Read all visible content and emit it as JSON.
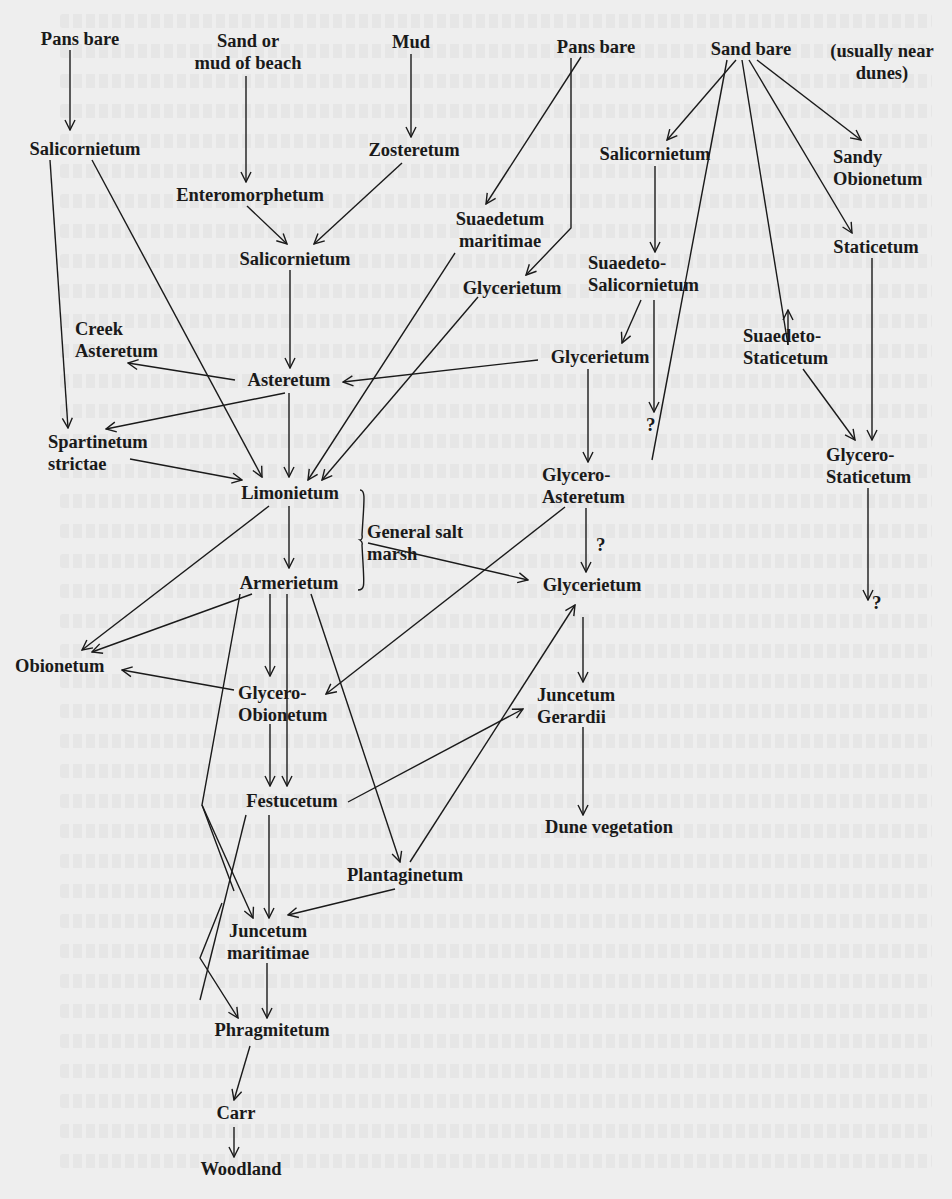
{
  "diagram": {
    "colors": {
      "paper": "#eeeeee",
      "ink": "#1a1a1a"
    },
    "nodes": {
      "pans_bare_1": "Pans bare",
      "sand_or_mud": "Sand or\nmud of beach",
      "mud": "Mud",
      "pans_bare_2": "Pans bare",
      "sand_bare": "Sand bare",
      "usually_near_dunes": "(usually near\ndunes)",
      "salicornietum_1": "Salicornietum",
      "zosteretum": "Zosteretum",
      "enteromorphetum": "Enteromorphetum",
      "salicornietum_2": "Salicornietum",
      "suaedetum_maritimae": "Suaedetum\nmaritimae",
      "salicornietum_3": "Salicornietum",
      "sandy_obionetum": "Sandy\nObionetum",
      "staticetum": "Staticetum",
      "suaedeto_salicornietum": "Suaedeto-\nSalicornietum",
      "glycerietum_1": "Glycerietum",
      "glycerietum_2": "Glycerietum",
      "suaedeto_staticetum": "Suaedeto-\nStaticetum",
      "creek_asteretum": "Creek\nAsteretum",
      "asteretum": "Asteretum",
      "spartinetum_strictae": "Spartinetum\nstrictae",
      "glycero_staticetum": "Glycero-\nStaticetum",
      "limonietum": "Limonietum",
      "glycero_asteretum": "Glycero-\nAsteretum",
      "general_salt_marsh": "General salt\nmarsh",
      "armerietum": "Armerietum",
      "glycerietum_3": "Glycerietum",
      "obionetum": "Obionetum",
      "glycero_obionetum": "Glycero-\nObionetum",
      "juncetum_gerardii": "Juncetum\nGerardii",
      "festucetum": "Festucetum",
      "dune_vegetation": "Dune vegetation",
      "plantaginetum": "Plantaginetum",
      "juncetum_maritimae": "Juncetum\nmaritimae",
      "phragmitetum": "Phragmitetum",
      "carr": "Carr",
      "woodland": "Woodland"
    },
    "unknown_marks": {
      "q1": "?",
      "q2": "?",
      "q3": "?"
    },
    "edges": [
      [
        "Pans bare",
        "Salicornietum"
      ],
      [
        "Sand or mud of beach",
        "Enteromorphetum"
      ],
      [
        "Mud",
        "Zosteretum"
      ],
      [
        "Enteromorphetum",
        "Salicornietum"
      ],
      [
        "Zosteretum",
        "Salicornietum"
      ],
      [
        "Pans bare",
        "Suaedetum maritimae"
      ],
      [
        "Pans bare",
        "Glycerietum"
      ],
      [
        "Sand bare",
        "Salicornietum"
      ],
      [
        "Sand bare",
        "Sandy Obionetum"
      ],
      [
        "Sand bare",
        "Staticetum"
      ],
      [
        "Sand bare",
        "Suaedeto-Staticetum"
      ],
      [
        "Sand bare",
        "?"
      ],
      [
        "Salicornietum",
        "Suaedeto-Salicornietum"
      ],
      [
        "Suaedeto-Salicornietum",
        "Glycerietum"
      ],
      [
        "Salicornietum",
        "Asteretum"
      ],
      [
        "Salicornietum",
        "Spartinetum strictae"
      ],
      [
        "Salicornietum",
        "Limonietum"
      ],
      [
        "Asteretum",
        "Creek Asteretum"
      ],
      [
        "Asteretum",
        "Spartinetum strictae"
      ],
      [
        "Asteretum",
        "Limonietum"
      ],
      [
        "Glycerietum",
        "Asteretum"
      ],
      [
        "Suaedetum maritimae",
        "Limonietum"
      ],
      [
        "Glycerietum",
        "Limonietum"
      ],
      [
        "Spartinetum strictae",
        "Limonietum"
      ],
      [
        "Glycerietum",
        "Glycero-Asteretum"
      ],
      [
        "Glycero-Asteretum",
        "Glycerietum (?)"
      ],
      [
        "Glycero-Asteretum",
        "Glycero-Obionetum"
      ],
      [
        "Suaedeto-Staticetum",
        "Glycero-Staticetum"
      ],
      [
        "Staticetum",
        "Glycero-Staticetum"
      ],
      [
        "Glycero-Staticetum",
        "?"
      ],
      [
        "Limonietum",
        "Armerietum"
      ],
      [
        "Limonietum",
        "Obionetum"
      ],
      [
        "General salt marsh",
        "Glycerietum"
      ],
      [
        "Armerietum",
        "Obionetum"
      ],
      [
        "Armerietum",
        "Glycero-Obionetum"
      ],
      [
        "Armerietum",
        "Festucetum"
      ],
      [
        "Armerietum",
        "Plantaginetum"
      ],
      [
        "Armerietum",
        "Phragmitetum"
      ],
      [
        "Glycero-Obionetum",
        "Obionetum"
      ],
      [
        "Glycero-Obionetum",
        "Festucetum"
      ],
      [
        "Glycerietum",
        "Juncetum Gerardii"
      ],
      [
        "Festucetum",
        "Juncetum Gerardii"
      ],
      [
        "Plantaginetum",
        "Glycerietum"
      ],
      [
        "Juncetum Gerardii",
        "Dune vegetation"
      ],
      [
        "Festucetum",
        "Juncetum maritimae"
      ],
      [
        "Festucetum",
        "Glycerietum"
      ],
      [
        "Plantaginetum",
        "Juncetum maritimae"
      ],
      [
        "Juncetum maritimae",
        "Phragmitetum"
      ],
      [
        "Phragmitetum",
        "Carr"
      ],
      [
        "Carr",
        "Woodland"
      ]
    ]
  }
}
